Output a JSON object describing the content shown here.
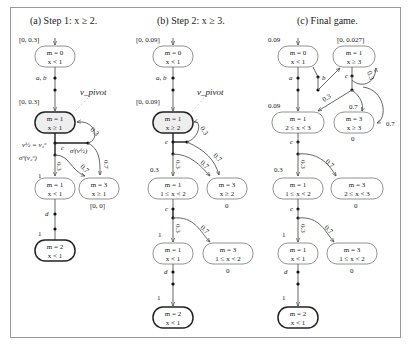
{
  "captions": {
    "a": "(a) Step 1: x ≥ 2.",
    "b": "(b) Step 2: x ≥ 3.",
    "c": "(c) Final game."
  },
  "panel_a": {
    "init_interval": "[0, 0.3]",
    "n0": {
      "l1": "m = 0",
      "l2": "x < 1"
    },
    "edge_ab": "a, b",
    "pivot": "v_pivot",
    "pivot_interval": "[0, 0.3]",
    "n1": {
      "l1": "m = 1",
      "l2": "x ≥ 1"
    },
    "v2": "v½ = v₂ᵘ",
    "sigma_u": "σᵘ(v₂ᵘ)",
    "sigma_l": "σˡ(v½)",
    "c": "c",
    "p03_back": "0.3",
    "p03_down": "0.3",
    "p07_mid": "0.7",
    "p07_right": "0.7",
    "val1": "1",
    "n2": {
      "l1": "m = 1",
      "l2": "x < 1"
    },
    "n3": {
      "l1": "m = 3",
      "l2": "x ≥ 1"
    },
    "n3_interval": "[0, 0]",
    "d": "d",
    "val_final": "1",
    "n4": {
      "l1": "m = 2",
      "l2": "x < 1"
    }
  },
  "panel_b": {
    "init_interval": "[0, 0.09]",
    "n0": {
      "l1": "m = 0",
      "l2": "x < 1"
    },
    "edge_ab": "a, b",
    "pivot": "v_pivot",
    "pivot_interval": "[0, 0.09]",
    "n1": {
      "l1": "m = 1",
      "l2": "x ≥ 2"
    },
    "c1": "c",
    "p03_back": "0.3",
    "p07_right": "0.7",
    "p03_down": "0.3",
    "p07_mid": "0.7",
    "val03": "0.3",
    "n2": {
      "l1": "m = 1",
      "l2": "1 ≤ x < 2"
    },
    "n3": {
      "l1": "m = 3",
      "l2": "x ≥ 2"
    },
    "n3_val": "0",
    "c2": "c",
    "p03_down2": "0.3",
    "p07_mid2": "0.7",
    "val1": "1",
    "n5": {
      "l1": "m = 1",
      "l2": "x < 1"
    },
    "n6": {
      "l1": "m = 3",
      "l2": "1 ≤ x < 2"
    },
    "n6_val": "0",
    "d": "d",
    "val_final": "1",
    "n7": {
      "l1": "m = 2",
      "l2": "x < 1"
    }
  },
  "panel_c": {
    "init_val": "0.09",
    "n0": {
      "l1": "m = 0",
      "l2": "x < 1"
    },
    "top_interval": "[0, 0.027]",
    "nT": {
      "l1": "m = 1",
      "l2": "x ≥ 3"
    },
    "a": "a",
    "b": "b",
    "c_top": "c",
    "p03_loop": "0.3",
    "p03_back": "0.3",
    "p07_mid": "0.7",
    "p07_right": "0.7",
    "val009": "0.09",
    "n1": {
      "l1": "m = 1",
      "l2": "2 ≤ x < 3"
    },
    "n3t": {
      "l1": "m = 3",
      "l2": "x ≥ 3"
    },
    "n3t_val": "0",
    "c1": "c",
    "p03_down": "0.3",
    "p07_d": "0.7",
    "val03": "0.3",
    "n2": {
      "l1": "m = 1",
      "l2": "1 ≤ x < 2"
    },
    "n3": {
      "l1": "m = 3",
      "l2": "2 ≤ x < 3"
    },
    "n3_val": "0",
    "c2": "c",
    "p03_down2": "0.3",
    "p07_d2": "0.7",
    "val1": "1",
    "n5": {
      "l1": "m = 1",
      "l2": "x < 1"
    },
    "n6": {
      "l1": "m = 3",
      "l2": "1 ≤ x < 2"
    },
    "n6_val": "0",
    "d": "d",
    "val_final": "1",
    "n7": {
      "l1": "m = 2",
      "l2": "x < 1"
    }
  }
}
